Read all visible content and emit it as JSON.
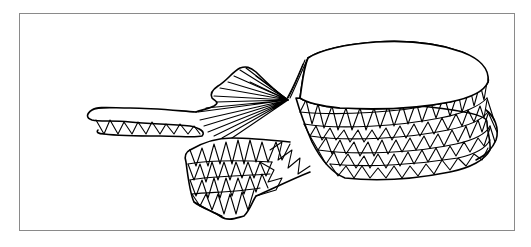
{
  "figure": {
    "caption": "",
    "colors": {
      "frame": "#8a8a8a",
      "mesh": "#000000",
      "background": "#ffffff"
    },
    "parts": [
      {
        "name": "vertebral-body",
        "label": ""
      },
      {
        "name": "transverse-process",
        "label": ""
      },
      {
        "name": "lamina-fan",
        "label": ""
      },
      {
        "name": "pedicle-block",
        "label": ""
      }
    ]
  }
}
